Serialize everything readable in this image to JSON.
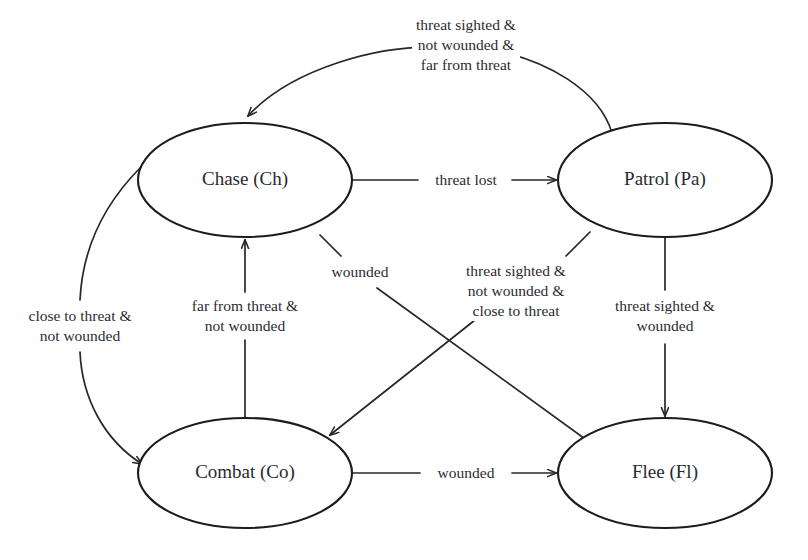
{
  "diagram": {
    "colors": {
      "background": "#ffffff",
      "stroke": "#26262c",
      "node_stroke": "#1b1b20",
      "text": "#2a2a30"
    },
    "nodes": [
      {
        "id": "chase",
        "label": "Chase (Ch)",
        "cx": 245,
        "cy": 180,
        "rx": 107,
        "ry": 57
      },
      {
        "id": "patrol",
        "label": "Patrol (Pa)",
        "cx": 665,
        "cy": 180,
        "rx": 107,
        "ry": 57
      },
      {
        "id": "combat",
        "label": "Combat (Co)",
        "cx": 245,
        "cy": 473,
        "rx": 107,
        "ry": 55
      },
      {
        "id": "flee",
        "label": "Flee (Fl)",
        "cx": 665,
        "cy": 473,
        "rx": 107,
        "ry": 55
      }
    ],
    "edges": [
      {
        "id": "patrol-to-chase",
        "from": "Patrol (Pa)",
        "to": "Chase (Ch)",
        "label": "threat sighted &\nnot wounded &\nfar from threat",
        "label_x": 466,
        "label_y": 45
      },
      {
        "id": "chase-to-patrol",
        "from": "Chase (Ch)",
        "to": "Patrol (Pa)",
        "label": "threat lost",
        "label_x": 466,
        "label_y": 180
      },
      {
        "id": "chase-to-combat",
        "from": "Chase (Ch)",
        "to": "Combat (Co)",
        "label": "close to threat &\nnot wounded",
        "label_x": 80,
        "label_y": 326
      },
      {
        "id": "combat-to-chase",
        "from": "Combat (Co)",
        "to": "Chase (Ch)",
        "label": "far from threat &\nnot wounded",
        "label_x": 245,
        "label_y": 316
      },
      {
        "id": "chase-to-flee",
        "from": "Chase (Ch)",
        "to": "Flee (Fl)",
        "label": "wounded",
        "label_x": 360,
        "label_y": 272
      },
      {
        "id": "patrol-to-combat",
        "from": "Patrol (Pa)",
        "to": "Combat (Co)",
        "label": "threat sighted &\nnot wounded &\nclose to threat",
        "label_x": 516,
        "label_y": 291
      },
      {
        "id": "patrol-to-flee",
        "from": "Patrol (Pa)",
        "to": "Flee (Fl)",
        "label": "threat sighted &\nwounded",
        "label_x": 665,
        "label_y": 316
      },
      {
        "id": "combat-to-flee",
        "from": "Combat (Co)",
        "to": "Flee (Fl)",
        "label": "wounded",
        "label_x": 466,
        "label_y": 473
      }
    ]
  }
}
